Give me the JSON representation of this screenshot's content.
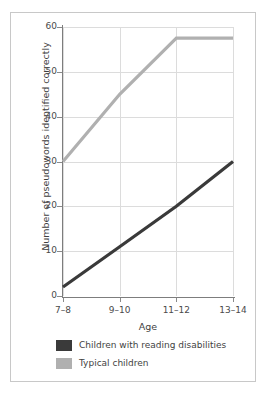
{
  "chart_data": {
    "type": "line",
    "title": "",
    "subtitle": "",
    "xlabel": "Age",
    "ylabel": "Number of pseudowords identified correctly",
    "categories": [
      "7–8",
      "9–10",
      "11–12",
      "13–14"
    ],
    "ylim": [
      0,
      60
    ],
    "yticks": [
      0,
      10,
      20,
      30,
      40,
      50,
      60
    ],
    "ytick_labels": [
      "0",
      "10",
      "20",
      "30",
      "40",
      "50",
      "60"
    ],
    "grid": "both",
    "legend_position": "below-plot",
    "series": [
      {
        "name": "Children with reading disabilities",
        "color": "#3a3a3a",
        "values": [
          2,
          11,
          20,
          30
        ]
      },
      {
        "name": "Typical children",
        "color": "#b0b0b0",
        "values": [
          30,
          45,
          57.5,
          57.5
        ]
      }
    ]
  },
  "legend": {
    "items": [
      {
        "label": "Children with reading disabilities",
        "color": "#3a3a3a"
      },
      {
        "label": "Typical children",
        "color": "#b0b0b0"
      }
    ]
  },
  "caption": {
    "clipped_text": ""
  },
  "colors": {
    "frame": "#c8c8c8",
    "grid": "#dcdcdc",
    "axis": "#7d7d7d",
    "text": "#3f3f3f",
    "background": "#ffffff"
  }
}
